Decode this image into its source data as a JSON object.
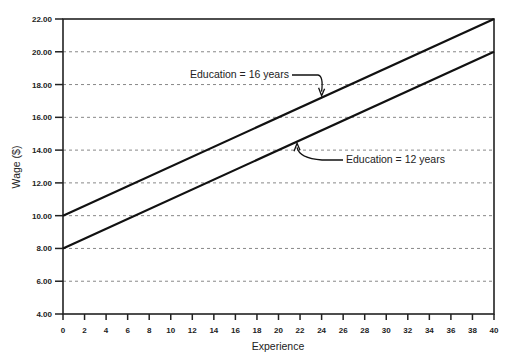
{
  "chart_data": {
    "type": "line",
    "title": "",
    "xlabel": "Experience",
    "ylabel": "Wage ($)",
    "xlim": [
      0,
      40
    ],
    "ylim": [
      4,
      22
    ],
    "grid": "horizontal dashed",
    "x_ticks": [
      "0",
      "2",
      "4",
      "6",
      "8",
      "10",
      "12",
      "14",
      "16",
      "18",
      "20",
      "22",
      "24",
      "26",
      "28",
      "30",
      "32",
      "34",
      "36",
      "38",
      "40"
    ],
    "y_ticks": [
      "4.00",
      "6.00",
      "8.00",
      "10.00",
      "12.00",
      "14.00",
      "16.00",
      "18.00",
      "20.00",
      "22.00"
    ],
    "series": [
      {
        "name": "Education = 16 years",
        "x": [
          0,
          40
        ],
        "values": [
          10.0,
          22.0
        ]
      },
      {
        "name": "Education = 12 years",
        "x": [
          0,
          40
        ],
        "values": [
          8.0,
          20.0
        ]
      }
    ],
    "annotations": [
      {
        "text": "Education = 16 years",
        "points_to_x": 24,
        "series": 0
      },
      {
        "text": "Education = 12 years",
        "points_to_x": 22,
        "series": 1
      }
    ]
  }
}
